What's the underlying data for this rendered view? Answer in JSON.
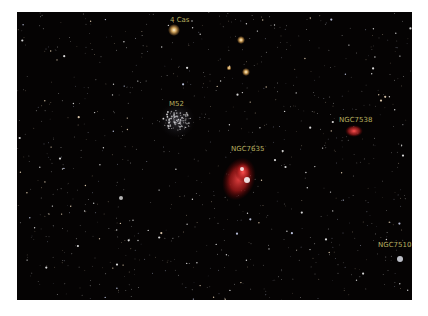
{
  "image": {
    "description": "Astrophotograph star field in Cassiopeia",
    "background_color": "#050303",
    "label_color": "#b8b060"
  },
  "labels": [
    {
      "id": "4cas",
      "text": "4 Cas",
      "x": 153,
      "y": 5
    },
    {
      "id": "m52",
      "text": "M52",
      "x": 152,
      "y": 89
    },
    {
      "id": "ngc7635",
      "text": "NGC7635",
      "x": 214,
      "y": 134
    },
    {
      "id": "ngc7538",
      "text": "NGC7538",
      "x": 322,
      "y": 105
    },
    {
      "id": "ngc7510",
      "text": "NGC7510",
      "x": 361,
      "y": 230
    }
  ]
}
